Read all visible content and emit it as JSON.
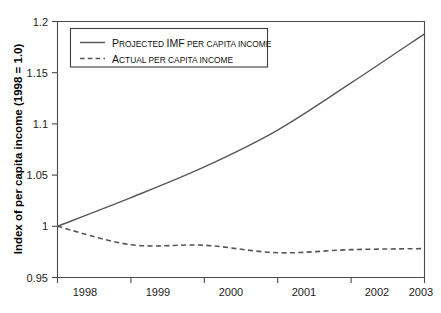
{
  "chart_data": {
    "type": "line",
    "title": "",
    "xlabel": "",
    "ylabel": "Index of per capita income (1998 = 1.0)",
    "x": [
      1998,
      1999,
      2000,
      2001,
      2002,
      2003
    ],
    "xtick_labels": [
      "1998",
      "1999",
      "2000",
      "2001",
      "2002",
      "2003"
    ],
    "ytick_labels": [
      "1.2",
      "1.15",
      "1.1",
      "1.05",
      "1",
      "0.95"
    ],
    "ytick_values": [
      1.2,
      1.15,
      1.1,
      1.05,
      1.0,
      0.95
    ],
    "ylim": [
      0.95,
      1.2
    ],
    "xlim": [
      1998,
      2003
    ],
    "grid": false,
    "legend_position": "top-left",
    "series": [
      {
        "name": "Projected IMF per capita income",
        "style": "solid",
        "color": "#5a5a62",
        "values": [
          1.0,
          1.028,
          1.058,
          1.094,
          1.14,
          1.188
        ]
      },
      {
        "name": "Actual per capita income",
        "style": "dashed",
        "color": "#55555d",
        "values": [
          1.0,
          0.982,
          0.9815,
          0.9742,
          0.9772,
          0.9782
        ]
      }
    ]
  },
  "legend": {
    "entries": [
      {
        "lead": "P",
        "rest_caps": "ROJECTED ",
        "mid": "IMF",
        "tail_caps": " PER CAPITA INCOME"
      },
      {
        "lead": "A",
        "rest_caps": "CTUAL PER CAPITA INCOME",
        "mid": "",
        "tail_caps": ""
      }
    ]
  },
  "axes": {
    "y_title": "Index of per capita income (1998 = 1.0)",
    "y_ticks": [
      "1.2",
      "1.15",
      "1.1",
      "1.05",
      "1",
      "0.95"
    ],
    "x_ticks": [
      "1998",
      "1999",
      "2000",
      "2001",
      "2002",
      "2003"
    ]
  }
}
